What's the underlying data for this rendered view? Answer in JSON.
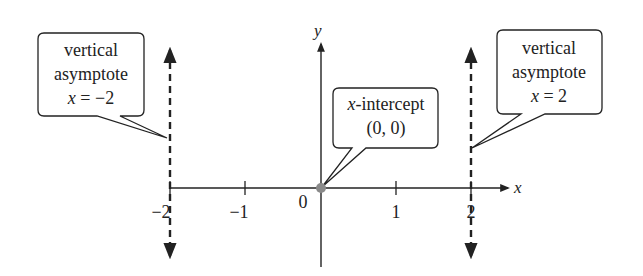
{
  "diagram": {
    "axes": {
      "x_label": "x",
      "y_label": "y",
      "origin_label": "0",
      "x_ticks": [
        {
          "value": -2,
          "label": "−2"
        },
        {
          "value": -1,
          "label": "−1"
        },
        {
          "value": 1,
          "label": "1"
        },
        {
          "value": 2,
          "label": "2"
        }
      ]
    },
    "asymptotes": [
      {
        "x": -2,
        "style": "dashed"
      },
      {
        "x": 2,
        "style": "dashed"
      }
    ],
    "point": {
      "x": 0,
      "y": 0,
      "color": "#8a8a8a"
    },
    "callouts": {
      "left": {
        "line1": "vertical",
        "line2": "asymptote",
        "eq_var": "x",
        "eq_rest": " = −2"
      },
      "right": {
        "line1": "vertical",
        "line2": "asymptote",
        "eq_var": "x",
        "eq_rest": " = 2"
      },
      "center": {
        "var": "x",
        "rest": "-intercept",
        "line2": "(0, 0)"
      }
    },
    "colors": {
      "line": "#222222",
      "point": "#8a8a8a",
      "background": "#ffffff"
    }
  }
}
